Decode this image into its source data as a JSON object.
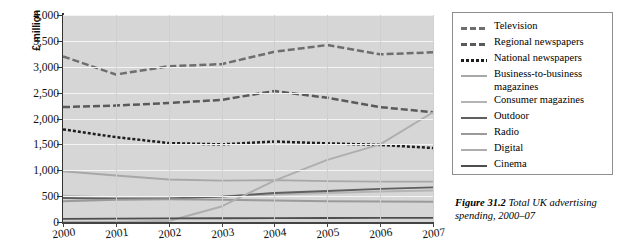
{
  "chart_data": {
    "type": "line",
    "title": "",
    "xlabel": "",
    "ylabel": "£ million",
    "x": [
      "2000",
      "2001",
      "2002",
      "2003",
      "2004",
      "2005",
      "2006",
      "2007"
    ],
    "ylim": [
      0,
      4000
    ],
    "yticks": [
      "0",
      "500",
      "1,000",
      "1,500",
      "2,000",
      "2,500",
      "3,000",
      "3,500",
      "4,000"
    ],
    "ytick_values": [
      0,
      500,
      1000,
      1500,
      2000,
      2500,
      3000,
      3500,
      4000
    ],
    "grid": "horizontal",
    "legend_position": "right",
    "series": [
      {
        "name": "Television",
        "values": [
          3200,
          2850,
          3010,
          3050,
          3290,
          3420,
          3240,
          3280
        ],
        "style": "dashed",
        "color": "#6e6e6e"
      },
      {
        "name": "Regional newspapers",
        "values": [
          2220,
          2250,
          2300,
          2360,
          2530,
          2400,
          2220,
          2120
        ],
        "style": "dashed",
        "color": "#5a5a5a"
      },
      {
        "name": "National newspapers",
        "values": [
          1790,
          1640,
          1525,
          1500,
          1555,
          1520,
          1490,
          1430
        ],
        "style": "dotted",
        "color": "#1d1d1d"
      },
      {
        "name": "Business-to-business magazines",
        "values": [
          980,
          900,
          820,
          800,
          810,
          790,
          780,
          780
        ],
        "style": "solid",
        "color": "#a8a8a8"
      },
      {
        "name": "Consumer magazines",
        "values": [
          510,
          475,
          470,
          490,
          530,
          560,
          590,
          610
        ],
        "style": "solid",
        "color": "#b4b4b4"
      },
      {
        "name": "Outdoor",
        "values": [
          465,
          450,
          455,
          490,
          560,
          600,
          640,
          670
        ],
        "style": "solid",
        "color": "#5f5f5f"
      },
      {
        "name": "Radio",
        "values": [
          400,
          430,
          440,
          430,
          415,
          400,
          395,
          390
        ],
        "style": "solid",
        "color": "#9a9a9a"
      },
      {
        "name": "Digital",
        "values": [
          0,
          0,
          20,
          300,
          800,
          1200,
          1500,
          2120
        ],
        "style": "solid",
        "color": "#aeaeae"
      },
      {
        "name": "Cinema",
        "values": [
          60,
          65,
          70,
          72,
          75,
          78,
          80,
          80
        ],
        "style": "solid",
        "color": "#4e4e4e"
      }
    ]
  },
  "legend": {
    "items": [
      {
        "label": "Television"
      },
      {
        "label": "Regional newspapers"
      },
      {
        "label": "National newspapers"
      },
      {
        "label": "Business-to-business magazines"
      },
      {
        "label": "Consumer magazines"
      },
      {
        "label": "Outdoor"
      },
      {
        "label": "Radio"
      },
      {
        "label": "Digital"
      },
      {
        "label": "Cinema"
      }
    ]
  },
  "caption": {
    "figure_number": "Figure 31.2",
    "text": "Total UK advertising spending, 2000–07"
  },
  "colors": {
    "plot_background": "#d6d6d6",
    "gridline": "#f4f4f4",
    "axis": "#333333",
    "legend_border": "#8e8e8e"
  }
}
